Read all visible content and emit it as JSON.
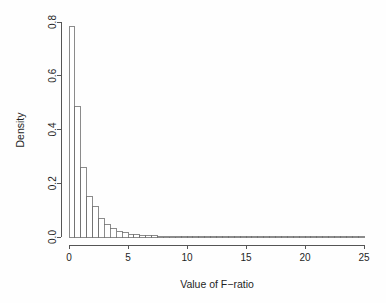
{
  "chart_data": {
    "type": "bar",
    "title": "",
    "subtitle": "",
    "xlabel": "Value of F−ratio",
    "ylabel": "Density",
    "xlim": [
      0,
      25
    ],
    "ylim": [
      0.0,
      0.8
    ],
    "grid": false,
    "legend": "none",
    "binwidth": 0.5,
    "x_ticks": [
      {
        "value": 0,
        "label": "0"
      },
      {
        "value": 5,
        "label": "5"
      },
      {
        "value": 10,
        "label": "10"
      },
      {
        "value": 15,
        "label": "15"
      },
      {
        "value": 20,
        "label": "20"
      },
      {
        "value": 25,
        "label": "25"
      }
    ],
    "y_ticks": [
      {
        "value": 0.0,
        "label": "0.0"
      },
      {
        "value": 0.2,
        "label": "0.2"
      },
      {
        "value": 0.4,
        "label": "0.4"
      },
      {
        "value": 0.6,
        "label": "0.6"
      },
      {
        "value": 0.8,
        "label": "0.8"
      }
    ],
    "bins": [
      {
        "x0": 0.0,
        "x1": 0.5,
        "density": 0.783
      },
      {
        "x0": 0.5,
        "x1": 1.0,
        "density": 0.484
      },
      {
        "x0": 1.0,
        "x1": 1.5,
        "density": 0.257
      },
      {
        "x0": 1.5,
        "x1": 2.0,
        "density": 0.149
      },
      {
        "x0": 2.0,
        "x1": 2.5,
        "density": 0.112
      },
      {
        "x0": 2.5,
        "x1": 3.0,
        "density": 0.067
      },
      {
        "x0": 3.0,
        "x1": 3.5,
        "density": 0.045
      },
      {
        "x0": 3.5,
        "x1": 4.0,
        "density": 0.03
      },
      {
        "x0": 4.0,
        "x1": 4.5,
        "density": 0.022
      },
      {
        "x0": 4.5,
        "x1": 5.0,
        "density": 0.016
      },
      {
        "x0": 5.0,
        "x1": 5.5,
        "density": 0.011
      },
      {
        "x0": 5.5,
        "x1": 6.0,
        "density": 0.008
      },
      {
        "x0": 6.0,
        "x1": 6.5,
        "density": 0.007
      },
      {
        "x0": 6.5,
        "x1": 7.0,
        "density": 0.006
      },
      {
        "x0": 7.0,
        "x1": 7.5,
        "density": 0.004
      },
      {
        "x0": 7.5,
        "x1": 8.0,
        "density": 0.003
      },
      {
        "x0": 8.0,
        "x1": 8.5,
        "density": 0.003
      },
      {
        "x0": 8.5,
        "x1": 9.0,
        "density": 0.002
      },
      {
        "x0": 9.0,
        "x1": 9.5,
        "density": 0.002
      },
      {
        "x0": 9.5,
        "x1": 10.0,
        "density": 0.0015
      },
      {
        "x0": 10.0,
        "x1": 10.5,
        "density": 0.0013
      },
      {
        "x0": 10.5,
        "x1": 11.0,
        "density": 0.0011
      },
      {
        "x0": 11.0,
        "x1": 11.5,
        "density": 0.001
      },
      {
        "x0": 11.5,
        "x1": 12.0,
        "density": 0.0009
      },
      {
        "x0": 12.0,
        "x1": 12.5,
        "density": 0.0008
      },
      {
        "x0": 12.5,
        "x1": 13.0,
        "density": 0.0007
      },
      {
        "x0": 13.0,
        "x1": 13.5,
        "density": 0.0006
      },
      {
        "x0": 13.5,
        "x1": 14.0,
        "density": 0.0006
      },
      {
        "x0": 14.0,
        "x1": 14.5,
        "density": 0.0005
      },
      {
        "x0": 14.5,
        "x1": 15.0,
        "density": 0.0005
      },
      {
        "x0": 15.0,
        "x1": 15.5,
        "density": 0.0004
      },
      {
        "x0": 15.5,
        "x1": 16.0,
        "density": 0.0004
      },
      {
        "x0": 16.0,
        "x1": 16.5,
        "density": 0.0003
      },
      {
        "x0": 16.5,
        "x1": 17.0,
        "density": 0.0003
      },
      {
        "x0": 17.0,
        "x1": 17.5,
        "density": 0.0003
      },
      {
        "x0": 17.5,
        "x1": 18.0,
        "density": 0.0002
      },
      {
        "x0": 18.0,
        "x1": 18.5,
        "density": 0.0002
      },
      {
        "x0": 18.5,
        "x1": 19.0,
        "density": 0.0002
      },
      {
        "x0": 19.0,
        "x1": 19.5,
        "density": 0.0002
      },
      {
        "x0": 19.5,
        "x1": 20.0,
        "density": 0.0002
      },
      {
        "x0": 20.0,
        "x1": 20.5,
        "density": 0.0001
      },
      {
        "x0": 20.5,
        "x1": 21.0,
        "density": 0.0001
      },
      {
        "x0": 21.0,
        "x1": 21.5,
        "density": 0.0001
      },
      {
        "x0": 21.5,
        "x1": 22.0,
        "density": 0.0001
      },
      {
        "x0": 22.0,
        "x1": 22.5,
        "density": 0.0001
      },
      {
        "x0": 22.5,
        "x1": 23.0,
        "density": 0.0001
      },
      {
        "x0": 23.0,
        "x1": 23.5,
        "density": 0.0001
      },
      {
        "x0": 23.5,
        "x1": 24.0,
        "density": 0.0001
      },
      {
        "x0": 24.0,
        "x1": 24.5,
        "density": 0.0001
      },
      {
        "x0": 24.5,
        "x1": 25.0,
        "density": 0.0001
      }
    ],
    "colors": {
      "bar_fill": "#ffffff",
      "bar_stroke": "#6e6e6e",
      "axis": "#555555",
      "text": "#1f1f1f",
      "background": "#fefefe"
    }
  }
}
